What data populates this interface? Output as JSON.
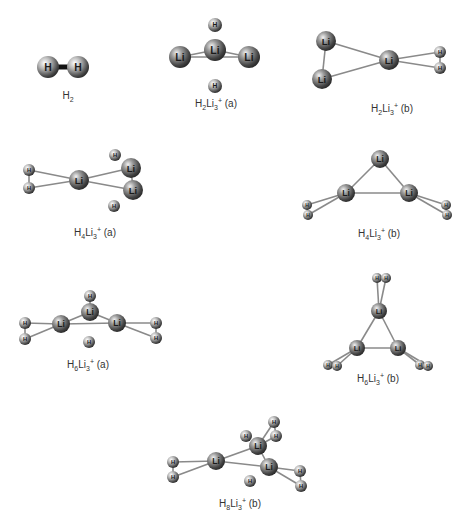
{
  "figure": {
    "background": "#ffffff",
    "atom_color": "#5a5a5a",
    "bond_color": "#8a8a8a",
    "h_bond_color": "#111111"
  },
  "structures": [
    {
      "id": "H2",
      "caption": {
        "base1": "H",
        "sub1": "2",
        "base2": "",
        "sub2": "",
        "sup": "",
        "suffix": ""
      },
      "caption_pos": [
        68,
        100
      ],
      "atoms": [
        {
          "el": "H",
          "x": 48,
          "y": 67,
          "r": 11
        },
        {
          "el": "H",
          "x": 78,
          "y": 67,
          "r": 11
        }
      ],
      "bonds": [
        [
          0,
          1,
          "thick"
        ]
      ]
    },
    {
      "id": "H2Li3+ (a)",
      "caption": {
        "base1": "H",
        "sub1": "2",
        "base2": "Li",
        "sub2": "3",
        "sup": "+",
        "suffix": " (a)"
      },
      "caption_pos": [
        216,
        108
      ],
      "atoms": [
        {
          "el": "H",
          "x": 215,
          "y": 25,
          "r": 7
        },
        {
          "el": "Li",
          "x": 180,
          "y": 57,
          "r": 11
        },
        {
          "el": "Li",
          "x": 215,
          "y": 50,
          "r": 11
        },
        {
          "el": "Li",
          "x": 249,
          "y": 57,
          "r": 11
        },
        {
          "el": "H",
          "x": 215,
          "y": 86,
          "r": 7
        }
      ],
      "bonds": [
        [
          1,
          2
        ],
        [
          2,
          3
        ],
        [
          1,
          3
        ]
      ]
    },
    {
      "id": "H2Li3+ (b)",
      "caption": {
        "base1": "H",
        "sub1": "2",
        "base2": "Li",
        "sub2": "3",
        "sup": "+",
        "suffix": " (b)"
      },
      "caption_pos": [
        392,
        113
      ],
      "atoms": [
        {
          "el": "Li",
          "x": 326,
          "y": 41,
          "r": 10
        },
        {
          "el": "Li",
          "x": 322,
          "y": 79,
          "r": 10
        },
        {
          "el": "Li",
          "x": 389,
          "y": 60,
          "r": 10
        },
        {
          "el": "H",
          "x": 440,
          "y": 52,
          "r": 6
        },
        {
          "el": "H",
          "x": 440,
          "y": 68,
          "r": 6
        }
      ],
      "bonds": [
        [
          0,
          1
        ],
        [
          0,
          2
        ],
        [
          1,
          2
        ],
        [
          2,
          3
        ],
        [
          2,
          4
        ],
        [
          3,
          4
        ]
      ]
    },
    {
      "id": "H4Li3+ (a)",
      "caption": {
        "base1": "H",
        "sub1": "4",
        "base2": "Li",
        "sub2": "3",
        "sup": "+",
        "suffix": " (a)"
      },
      "caption_pos": [
        95,
        237
      ],
      "atoms": [
        {
          "el": "H",
          "x": 29,
          "y": 170,
          "r": 6
        },
        {
          "el": "H",
          "x": 29,
          "y": 188,
          "r": 6
        },
        {
          "el": "Li",
          "x": 79,
          "y": 180,
          "r": 10
        },
        {
          "el": "H",
          "x": 115,
          "y": 155,
          "r": 6
        },
        {
          "el": "Li",
          "x": 131,
          "y": 168,
          "r": 10
        },
        {
          "el": "Li",
          "x": 133,
          "y": 190,
          "r": 10
        },
        {
          "el": "H",
          "x": 114,
          "y": 206,
          "r": 6
        }
      ],
      "bonds": [
        [
          0,
          2
        ],
        [
          1,
          2
        ],
        [
          0,
          1
        ],
        [
          2,
          4
        ],
        [
          2,
          5
        ],
        [
          4,
          5
        ]
      ]
    },
    {
      "id": "H4Li3+ (b)",
      "caption": {
        "base1": "H",
        "sub1": "4",
        "base2": "Li",
        "sub2": "3",
        "sup": "+",
        "suffix": " (b)"
      },
      "caption_pos": [
        379,
        238
      ],
      "atoms": [
        {
          "el": "Li",
          "x": 380,
          "y": 159,
          "r": 9
        },
        {
          "el": "Li",
          "x": 346,
          "y": 193,
          "r": 9
        },
        {
          "el": "Li",
          "x": 409,
          "y": 193,
          "r": 9
        },
        {
          "el": "H",
          "x": 307,
          "y": 205,
          "r": 5
        },
        {
          "el": "H",
          "x": 308,
          "y": 215,
          "r": 5
        },
        {
          "el": "H",
          "x": 446,
          "y": 205,
          "r": 5
        },
        {
          "el": "H",
          "x": 447,
          "y": 215,
          "r": 5
        }
      ],
      "bonds": [
        [
          0,
          1
        ],
        [
          0,
          2
        ],
        [
          1,
          2
        ],
        [
          1,
          3
        ],
        [
          1,
          4
        ],
        [
          3,
          4
        ],
        [
          2,
          5
        ],
        [
          2,
          6
        ],
        [
          5,
          6
        ]
      ]
    },
    {
      "id": "H6Li3+ (a)",
      "caption": {
        "base1": "H",
        "sub1": "6",
        "base2": "Li",
        "sub2": "3",
        "sup": "+",
        "suffix": " (a)"
      },
      "caption_pos": [
        88,
        369
      ],
      "atoms": [
        {
          "el": "H",
          "x": 90,
          "y": 296,
          "r": 6
        },
        {
          "el": "Li",
          "x": 90,
          "y": 312,
          "r": 9
        },
        {
          "el": "H",
          "x": 25,
          "y": 323,
          "r": 6
        },
        {
          "el": "H",
          "x": 25,
          "y": 339,
          "r": 6
        },
        {
          "el": "Li",
          "x": 61,
          "y": 324,
          "r": 9
        },
        {
          "el": "Li",
          "x": 117,
          "y": 323,
          "r": 9
        },
        {
          "el": "H",
          "x": 156,
          "y": 323,
          "r": 6
        },
        {
          "el": "H",
          "x": 156,
          "y": 338,
          "r": 6
        },
        {
          "el": "H",
          "x": 89,
          "y": 342,
          "r": 6
        }
      ],
      "bonds": [
        [
          0,
          1
        ],
        [
          1,
          4
        ],
        [
          1,
          5
        ],
        [
          4,
          5
        ],
        [
          2,
          4
        ],
        [
          3,
          4
        ],
        [
          2,
          3
        ],
        [
          5,
          6
        ],
        [
          5,
          7
        ],
        [
          6,
          7
        ]
      ]
    },
    {
      "id": "H6Li3+ (b)",
      "caption": {
        "base1": "H",
        "sub1": "6",
        "base2": "Li",
        "sub2": "3",
        "sup": "+",
        "suffix": " (b)"
      },
      "caption_pos": [
        378,
        383
      ],
      "atoms": [
        {
          "el": "H",
          "x": 377,
          "y": 278,
          "r": 5
        },
        {
          "el": "H",
          "x": 386,
          "y": 278,
          "r": 5
        },
        {
          "el": "Li",
          "x": 379,
          "y": 311,
          "r": 8
        },
        {
          "el": "Li",
          "x": 357,
          "y": 348,
          "r": 8
        },
        {
          "el": "Li",
          "x": 398,
          "y": 348,
          "r": 8
        },
        {
          "el": "H",
          "x": 328,
          "y": 365,
          "r": 5
        },
        {
          "el": "H",
          "x": 337,
          "y": 366,
          "r": 5
        },
        {
          "el": "H",
          "x": 420,
          "y": 365,
          "r": 5
        },
        {
          "el": "H",
          "x": 428,
          "y": 366,
          "r": 5
        }
      ],
      "bonds": [
        [
          0,
          2
        ],
        [
          1,
          2
        ],
        [
          0,
          1
        ],
        [
          2,
          3
        ],
        [
          2,
          4
        ],
        [
          3,
          4
        ],
        [
          3,
          5
        ],
        [
          3,
          6
        ],
        [
          5,
          6
        ],
        [
          4,
          7
        ],
        [
          4,
          8
        ],
        [
          7,
          8
        ]
      ]
    },
    {
      "id": "H8Li3+ (b)",
      "caption": {
        "base1": "H",
        "sub1": "8",
        "base2": "Li",
        "sub2": "3",
        "sup": "+",
        "suffix": " (b)"
      },
      "caption_pos": [
        240,
        508
      ],
      "atoms": [
        {
          "el": "H",
          "x": 274,
          "y": 422,
          "r": 6
        },
        {
          "el": "H",
          "x": 246,
          "y": 436,
          "r": 6
        },
        {
          "el": "H",
          "x": 276,
          "y": 436,
          "r": 6
        },
        {
          "el": "Li",
          "x": 258,
          "y": 446,
          "r": 9
        },
        {
          "el": "H",
          "x": 173,
          "y": 462,
          "r": 6
        },
        {
          "el": "H",
          "x": 173,
          "y": 477,
          "r": 6
        },
        {
          "el": "Li",
          "x": 216,
          "y": 461,
          "r": 9
        },
        {
          "el": "Li",
          "x": 269,
          "y": 467,
          "r": 9
        },
        {
          "el": "H",
          "x": 250,
          "y": 481,
          "r": 6
        },
        {
          "el": "H",
          "x": 300,
          "y": 471,
          "r": 6
        },
        {
          "el": "H",
          "x": 301,
          "y": 486,
          "r": 6
        }
      ],
      "bonds": [
        [
          0,
          3
        ],
        [
          2,
          3
        ],
        [
          0,
          2
        ],
        [
          3,
          6
        ],
        [
          3,
          7
        ],
        [
          6,
          7
        ],
        [
          4,
          6
        ],
        [
          5,
          6
        ],
        [
          4,
          5
        ],
        [
          7,
          9
        ],
        [
          7,
          10
        ],
        [
          9,
          10
        ]
      ]
    }
  ]
}
